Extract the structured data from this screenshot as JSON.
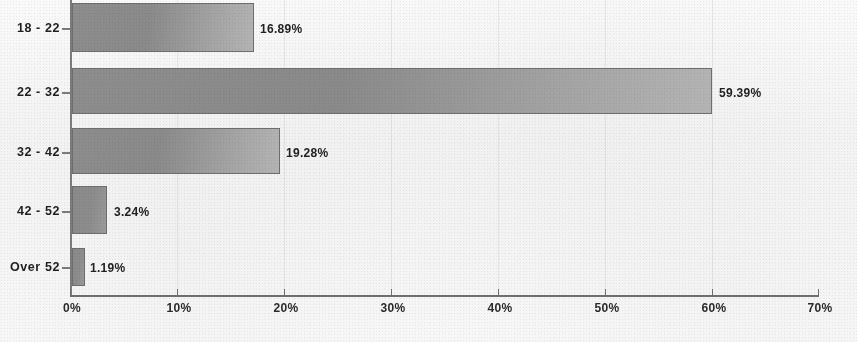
{
  "chart_data": {
    "type": "bar",
    "orientation": "horizontal",
    "title": "",
    "subtitle": "",
    "xlabel": "",
    "ylabel": "",
    "categories": [
      "18 - 22",
      "22 - 32",
      "32 - 42",
      "42 - 52",
      "Over 52"
    ],
    "values": [
      16.89,
      59.39,
      19.28,
      3.24,
      1.19
    ],
    "value_labels": [
      "16.89%",
      "59.39%",
      "19.28%",
      "3.24%",
      "1.19%"
    ],
    "xlim": [
      0,
      70
    ],
    "ylim": null,
    "x_tick_labels": [
      "0%",
      "10%",
      "20%",
      "30%",
      "40%",
      "50%",
      "60%",
      "70%"
    ],
    "x_tick_values": [
      0,
      10,
      20,
      30,
      40,
      50,
      60,
      70
    ],
    "grid": "faint-vertical",
    "legend": null,
    "legend_position": "none",
    "series": [
      {
        "name": "Age distribution",
        "values": [
          16.89,
          59.39,
          19.28,
          3.24,
          1.19
        ]
      }
    ],
    "annotations": [],
    "colors": {
      "bar_fill_dark": "#8d8d8d",
      "bar_fill_light": "#b4b4b4",
      "bar_border": "#6e6e6e",
      "axis": "#6f6f6f",
      "text": "#1f1f1f",
      "background": "#f8f8f8",
      "gridline": "#8c8c8c"
    }
  }
}
